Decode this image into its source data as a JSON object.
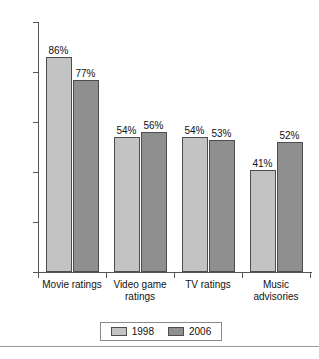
{
  "chart_data": {
    "type": "bar",
    "title": "",
    "subtitle": "",
    "xlabel": "",
    "ylabel": "",
    "ylim": [
      0,
      100
    ],
    "yticks": [
      0,
      20,
      40,
      60,
      80,
      100
    ],
    "ytick_labels": [
      "0",
      "20",
      "40",
      "60",
      "80",
      "100"
    ],
    "grid": false,
    "legend_position": "bottom-center",
    "categories": [
      "Movie ratings",
      "Video game\nratings",
      "TV ratings",
      "Music\nadvisories"
    ],
    "series": [
      {
        "name": "1998",
        "color": "#c3c3c3",
        "values": [
          86,
          54,
          54,
          41
        ],
        "data_labels": [
          "86%",
          "54%",
          "54%",
          "41%"
        ]
      },
      {
        "name": "2006",
        "color": "#8f8f8f",
        "values": [
          77,
          56,
          53,
          52
        ],
        "data_labels": [
          "77%",
          "56%",
          "53%",
          "52%"
        ]
      }
    ]
  },
  "legend": {
    "entries": [
      {
        "label": "1998",
        "swatch": "legend-swatch-1998"
      },
      {
        "label": "2006",
        "swatch": "legend-swatch-2006"
      }
    ]
  },
  "colors": {
    "series_1998": "#c3c3c3",
    "series_2006": "#8f8f8f",
    "axis": "#555555",
    "bar_outline": "#4d4d4d",
    "text": "#111111",
    "background": "#ffffff",
    "rule": "#9a9a9a"
  }
}
